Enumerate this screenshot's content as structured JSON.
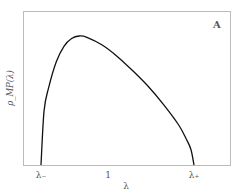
{
  "chart_data": {
    "type": "line",
    "title": "",
    "panel_label": "A",
    "xlabel": "λ",
    "ylabel": "ρ_MP(λ)",
    "x_ticks": [
      "λ₋",
      "1",
      "λ₊"
    ],
    "y_ticks": [],
    "grid": false,
    "legend": null,
    "series": [
      {
        "name": "ρ_MP(λ)",
        "x_relative": [
          0.0,
          0.02,
          0.05,
          0.1,
          0.15,
          0.2,
          0.25,
          0.3,
          0.4,
          0.5,
          0.6,
          0.7,
          0.8,
          0.9,
          0.95,
          0.98,
          1.0
        ],
        "y_relative": [
          0.0,
          0.42,
          0.6,
          0.8,
          0.92,
          0.98,
          1.0,
          0.99,
          0.93,
          0.84,
          0.73,
          0.61,
          0.47,
          0.31,
          0.2,
          0.12,
          0.0
        ]
      }
    ]
  }
}
